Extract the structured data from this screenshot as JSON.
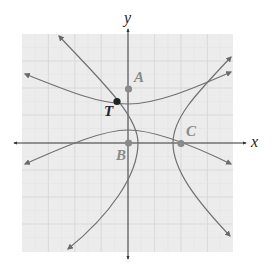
{
  "figure": {
    "axes": {
      "x_label": "x",
      "y_label": "y"
    },
    "grid": {
      "columns": 8,
      "rows": 8,
      "x_range": [
        -4,
        4
      ],
      "y_range": [
        -4,
        4
      ]
    },
    "points": [
      {
        "label": "A",
        "x": 0,
        "y": 2,
        "color": "#8a8a8a"
      },
      {
        "label": "B",
        "x": 0,
        "y": 0,
        "color": "#8a8a8a"
      },
      {
        "label": "C",
        "x": 2,
        "y": 0,
        "color": "#8a8a8a"
      },
      {
        "label": "T",
        "x": -0.4,
        "y": 1.5,
        "color": "#222222"
      }
    ],
    "curves": [
      {
        "name": "vertical-hyperbola",
        "orientation": "opens up/down",
        "center": [
          0,
          1
        ],
        "upper_vertex_y": 1.45,
        "lower_vertex_y": 0.5
      },
      {
        "name": "horizontal-hyperbola",
        "orientation": "opens left/right",
        "center": [
          1,
          0
        ],
        "left_vertex_x": 0.35,
        "right_vertex_x": 1.7
      }
    ],
    "colors": {
      "grid_bg": "#ececec",
      "grid_line": "#d6d6d6",
      "curve": "#707070",
      "axis": "#444444",
      "label_gray": "#8a8a8a",
      "label_dark": "#222222"
    }
  }
}
